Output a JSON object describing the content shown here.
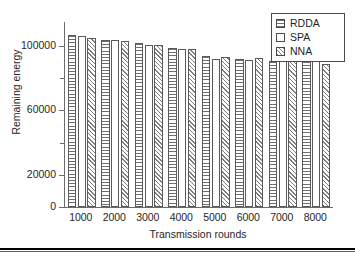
{
  "figure": {
    "background": "#ffffff",
    "frame_color": "#6b6b6b"
  },
  "legend": {
    "position": "top-right",
    "items": [
      {
        "label": "RDDA",
        "pattern": "horizontal-lines",
        "swatch_name": "legend-swatch-rdda"
      },
      {
        "label": "SPA",
        "pattern": "empty",
        "swatch_name": "legend-swatch-spa"
      },
      {
        "label": "NNA",
        "pattern": "diagonal-hatch",
        "swatch_name": "legend-swatch-nna"
      }
    ]
  },
  "axes": {
    "y_ticks": [
      "0",
      "20000",
      "60000",
      "100000"
    ],
    "x_title": "Transmission rounds",
    "y_title": "Remaining energy"
  },
  "chart_data": {
    "type": "bar",
    "title": "",
    "xlabel": "Transmission rounds",
    "ylabel": "Remaining energy",
    "categories": [
      "1000",
      "2000",
      "3000",
      "4000",
      "5000",
      "6000",
      "7000",
      "8000"
    ],
    "series": [
      {
        "name": "RDDA",
        "pattern": "horizontal-lines",
        "values": [
          107000,
          104000,
          102000,
          99000,
          94000,
          92000,
          91000,
          91000
        ]
      },
      {
        "name": "SPA",
        "pattern": "empty",
        "values": [
          106000,
          104000,
          100500,
          98000,
          92000,
          91500,
          91000,
          91000
        ]
      },
      {
        "name": "NNA",
        "pattern": "diagonal-hatch",
        "values": [
          105000,
          103000,
          100500,
          98000,
          93000,
          92500,
          91000,
          89000
        ]
      }
    ],
    "ylim": [
      0,
      115000
    ],
    "y_tick_values": [
      0,
      20000,
      60000,
      100000
    ],
    "y_minor_tick_values": [
      40000,
      80000
    ],
    "grid": false,
    "legend_position": "top-right"
  }
}
